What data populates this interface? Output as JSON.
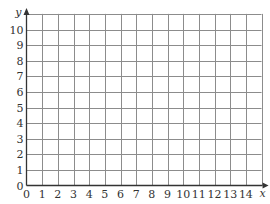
{
  "figure": {
    "type": "coordinate-grid",
    "x_axis": {
      "label": "x",
      "min": 0,
      "max": 14,
      "grid_extent": 15,
      "step": 1,
      "tick_labels": [
        "0",
        "1",
        "2",
        "3",
        "4",
        "5",
        "6",
        "7",
        "8",
        "9",
        "10",
        "11",
        "12",
        "13",
        "14"
      ]
    },
    "y_axis": {
      "label": "y",
      "min": 0,
      "max": 10,
      "grid_extent": 11,
      "step": 1,
      "tick_labels": [
        "0",
        "1",
        "2",
        "3",
        "4",
        "5",
        "6",
        "7",
        "8",
        "9",
        "10"
      ]
    },
    "colors": {
      "grid": "#8c8c8c",
      "axis": "#333333",
      "text": "#333333",
      "background": "#ffffff"
    },
    "grid_on": true,
    "arrows": [
      "x-positive",
      "y-positive"
    ]
  }
}
